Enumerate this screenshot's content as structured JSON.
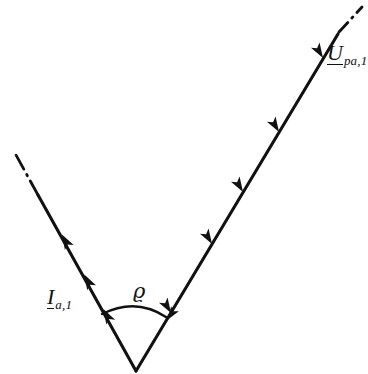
{
  "figure": {
    "type": "phasor-diagram",
    "background_color": "#ffffff",
    "stroke_color": "#111111",
    "title": "",
    "labels": {
      "current": {
        "symbol": "I",
        "subscript": "a,1",
        "full": "I_a,1",
        "underlined": true
      },
      "voltage": {
        "symbol": "U",
        "subscript": "pa,1",
        "full": "U_pa,1",
        "underlined": true
      },
      "angle": {
        "symbol": "ϱ",
        "full": "ϱ"
      }
    },
    "geometry": {
      "vertex": {
        "x": 136,
        "y": 371
      },
      "current_ray": {
        "tip_x": 38,
        "tip_y": 195,
        "dashdot_end_x": 16,
        "dashdot_end_y": 155,
        "arrow_count": 3
      },
      "voltage_ray": {
        "tip_x": 338,
        "tip_y": 34,
        "dashdot_end_x": 361,
        "dashdot_end_y": 8,
        "arrow_count": 5
      },
      "angle_arc": {
        "start_x": 102,
        "start_y": 314,
        "end_x": 167,
        "end_y": 318,
        "radius": 61,
        "arrowhead_at": "end"
      }
    }
  }
}
